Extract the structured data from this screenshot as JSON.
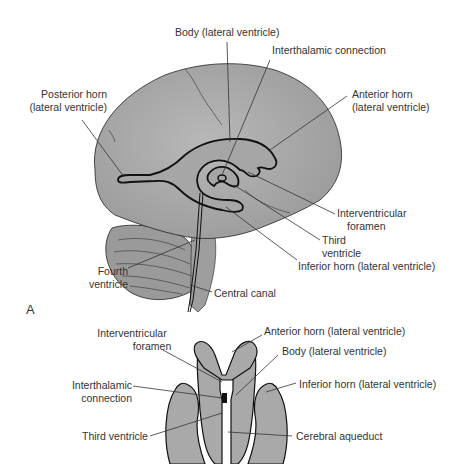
{
  "figure": {
    "panel_a": {
      "letter": "A",
      "labels": {
        "body": "Body (lateral ventricle)",
        "interthalamic": "Interthalamic connection",
        "posterior_horn_1": "Posterior horn",
        "posterior_horn_2": "(lateral ventricle)",
        "anterior_horn_1": "Anterior horn",
        "anterior_horn_2": "(lateral ventricle)",
        "interventricular_1": "Interventricular",
        "interventricular_2": "foramen",
        "third_1": "Third",
        "third_2": "ventricle",
        "inferior_horn": "Inferior horn (lateral ventricle)",
        "fourth_1": "Fourth",
        "fourth_2": "ventricle",
        "central_canal": "Central canal"
      }
    },
    "panel_b": {
      "labels": {
        "interventricular_1": "Interventricular",
        "interventricular_2": "foramen",
        "anterior_horn": "Anterior horn (lateral ventricle)",
        "body": "Body (lateral ventricle)",
        "interthalamic_1": "Interthalamic",
        "interthalamic_2": "connection",
        "inferior_horn": "Inferior horn (lateral ventricle)",
        "third_ventricle": "Third ventricle",
        "cerebral_aqueduct": "Cerebral aqueduct"
      }
    },
    "colors": {
      "tissue": "#a9a9a9",
      "outline": "#222222",
      "leader": "#333333"
    }
  }
}
